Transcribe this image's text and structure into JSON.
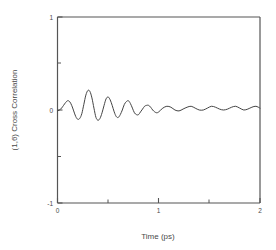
{
  "chart_data": {
    "type": "line",
    "title": "",
    "xlabel": "Time (ps)",
    "ylabel": "(1,6) Cross Correlation",
    "xlim": [
      0,
      2
    ],
    "ylim": [
      -1,
      1
    ],
    "grid": false,
    "legend": "none",
    "x_ticks_major": [
      0,
      1,
      2
    ],
    "x_tick_labels": [
      "0",
      "1",
      "2"
    ],
    "x_ticks_minor": [
      0.5,
      1.5
    ],
    "y_ticks_major": [
      -1,
      0,
      1
    ],
    "y_tick_labels": [
      "-1",
      "0",
      "1"
    ],
    "y_ticks_minor": [
      -0.5,
      0.5
    ],
    "series": [
      {
        "name": "(1,6) cross correlation",
        "description": "Damped oscillatory cross-correlation decaying from about +/-0.22 near t=0.25 ps to a small residual ripple of about 0.02 amplitude centered slightly above zero by t=1 ps",
        "color": "#444444",
        "x": [
          0.0,
          0.02,
          0.04,
          0.06,
          0.08,
          0.1,
          0.12,
          0.14,
          0.16,
          0.18,
          0.2,
          0.22,
          0.24,
          0.26,
          0.28,
          0.3,
          0.32,
          0.34,
          0.36,
          0.38,
          0.4,
          0.42,
          0.44,
          0.46,
          0.48,
          0.5,
          0.52,
          0.54,
          0.56,
          0.58,
          0.6,
          0.62,
          0.64,
          0.66,
          0.68,
          0.7,
          0.72,
          0.74,
          0.76,
          0.78,
          0.8,
          0.82,
          0.84,
          0.86,
          0.88,
          0.9,
          0.92,
          0.94,
          0.96,
          0.98,
          1.0,
          1.04,
          1.08,
          1.12,
          1.16,
          1.2,
          1.24,
          1.28,
          1.32,
          1.36,
          1.4,
          1.44,
          1.48,
          1.52,
          1.56,
          1.6,
          1.64,
          1.68,
          1.72,
          1.76,
          1.8,
          1.84,
          1.88,
          1.92,
          1.96,
          2.0
        ],
        "y": [
          -0.01,
          0.0,
          0.02,
          0.05,
          0.08,
          0.1,
          0.09,
          0.05,
          -0.01,
          -0.07,
          -0.1,
          -0.09,
          -0.04,
          0.06,
          0.16,
          0.21,
          0.2,
          0.13,
          0.02,
          -0.08,
          -0.11,
          -0.09,
          -0.03,
          0.05,
          0.12,
          0.14,
          0.11,
          0.05,
          -0.02,
          -0.07,
          -0.08,
          -0.05,
          0.0,
          0.06,
          0.09,
          0.1,
          0.07,
          0.02,
          -0.03,
          -0.05,
          -0.05,
          -0.02,
          0.01,
          0.04,
          0.05,
          0.05,
          0.03,
          0.0,
          -0.02,
          -0.03,
          -0.02,
          0.02,
          0.04,
          0.03,
          0.0,
          -0.01,
          0.01,
          0.03,
          0.04,
          0.02,
          0.0,
          0.0,
          0.02,
          0.04,
          0.03,
          0.01,
          0.0,
          0.01,
          0.03,
          0.04,
          0.02,
          0.0,
          0.01,
          0.03,
          0.04,
          0.02
        ]
      }
    ]
  },
  "axes": {
    "x_title": "Time (ps)",
    "y_title": "(1,6) Cross Correlation",
    "x_labels": [
      "0",
      "1",
      "2"
    ],
    "y_labels": [
      "1",
      "0",
      "-1"
    ]
  },
  "style": {
    "line_color": "#444444",
    "axis_color": "#555555",
    "text_color": "#4a4a4a",
    "background": "#ffffff"
  }
}
